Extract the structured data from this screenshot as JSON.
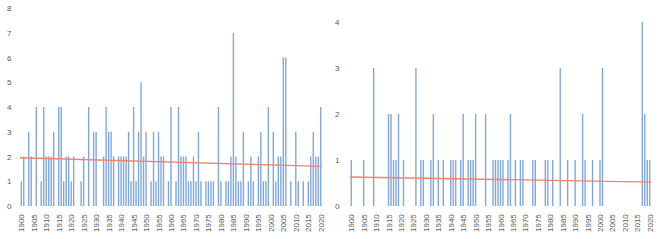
{
  "chart_data": [
    {
      "type": "bar",
      "title": "",
      "xlabel": "",
      "ylabel": "",
      "ylim": [
        0,
        8
      ],
      "yticks": [
        0,
        1,
        2,
        3,
        4,
        5,
        6,
        7,
        8
      ],
      "xtick_labels": [
        "1900",
        "1905",
        "1910",
        "1915",
        "1920",
        "1925",
        "1930",
        "1935",
        "1940",
        "1945",
        "1950",
        "1955",
        "1960",
        "1965",
        "1970",
        "1975",
        "1980",
        "1985",
        "1990",
        "1995",
        "2000",
        "2005",
        "2010",
        "2015",
        "2020"
      ],
      "x_start": 1900,
      "x_end": 2020,
      "grid": false,
      "bar_color": "#7ea6e0",
      "trendline": {
        "type": "linear",
        "color": "#f4826c",
        "start": 1.95,
        "end": 1.6
      },
      "years": [
        1900,
        1901,
        1903,
        1904,
        1906,
        1908,
        1909,
        1910,
        1911,
        1912,
        1913,
        1915,
        1916,
        1917,
        1918,
        1919,
        1920,
        1921,
        1924,
        1925,
        1927,
        1929,
        1930,
        1933,
        1934,
        1935,
        1936,
        1937,
        1939,
        1940,
        1941,
        1942,
        1943,
        1944,
        1945,
        1946,
        1947,
        1948,
        1949,
        1950,
        1952,
        1953,
        1954,
        1955,
        1956,
        1957,
        1959,
        1960,
        1962,
        1963,
        1964,
        1965,
        1966,
        1967,
        1968,
        1969,
        1970,
        1971,
        1972,
        1974,
        1975,
        1976,
        1977,
        1979,
        1980,
        1982,
        1983,
        1984,
        1985,
        1986,
        1987,
        1988,
        1989,
        1991,
        1992,
        1993,
        1995,
        1996,
        1997,
        1998,
        1999,
        2001,
        2002,
        2003,
        2004,
        2005,
        2006,
        2008,
        2010,
        2011,
        2013,
        2015,
        2016,
        2017,
        2018,
        2019,
        2020
      ],
      "values": [
        1,
        2,
        3,
        2,
        4,
        1,
        4,
        2,
        2,
        2,
        3,
        4,
        4,
        1,
        2,
        2,
        1,
        2,
        1,
        2,
        4,
        3,
        3,
        2,
        4,
        3,
        3,
        2,
        2,
        2,
        2,
        2,
        3,
        1,
        4,
        1,
        3,
        5,
        2,
        3,
        1,
        3,
        1,
        3,
        2,
        2,
        1,
        4,
        1,
        4,
        2,
        2,
        2,
        1,
        1,
        2,
        1,
        3,
        1,
        1,
        1,
        1,
        1,
        4,
        1,
        1,
        1,
        2,
        7,
        2,
        1,
        1,
        3,
        1,
        2,
        1,
        2,
        3,
        1,
        1,
        4,
        3,
        1,
        2,
        2,
        6,
        6,
        1,
        3,
        1,
        1,
        1,
        2,
        3,
        2,
        2,
        4
      ]
    },
    {
      "type": "bar",
      "title": "",
      "xlabel": "",
      "ylabel": "",
      "ylim": [
        0,
        4
      ],
      "yticks": [
        0,
        1,
        2,
        3,
        4
      ],
      "xtick_labels": [
        "1900",
        "1905",
        "1910",
        "1915",
        "1920",
        "1925",
        "1930",
        "1935",
        "1940",
        "1945",
        "1950",
        "1955",
        "1960",
        "1965",
        "1970",
        "1975",
        "1980",
        "1985",
        "1990",
        "1995",
        "2000",
        "2005",
        "2010",
        "2015",
        "2020"
      ],
      "x_start": 1900,
      "x_end": 2020,
      "grid": false,
      "bar_color": "#7ea6e0",
      "trendline": {
        "type": "linear",
        "color": "#f4826c",
        "start": 0.63,
        "end": 0.52
      },
      "years": [
        1900,
        1905,
        1909,
        1915,
        1916,
        1917,
        1918,
        1919,
        1921,
        1926,
        1928,
        1929,
        1932,
        1933,
        1935,
        1937,
        1940,
        1941,
        1942,
        1944,
        1945,
        1947,
        1948,
        1949,
        1950,
        1954,
        1957,
        1958,
        1959,
        1960,
        1961,
        1963,
        1964,
        1966,
        1968,
        1969,
        1973,
        1974,
        1978,
        1979,
        1981,
        1984,
        1987,
        1990,
        1993,
        1994,
        1997,
        2000,
        2001,
        2017,
        2018,
        2019,
        2020
      ],
      "values": [
        1,
        1,
        3,
        2,
        2,
        1,
        1,
        2,
        1,
        3,
        1,
        1,
        1,
        2,
        1,
        1,
        1,
        1,
        1,
        1,
        2,
        1,
        1,
        1,
        2,
        2,
        1,
        1,
        1,
        1,
        1,
        1,
        2,
        1,
        1,
        1,
        1,
        1,
        1,
        1,
        1,
        3,
        1,
        1,
        2,
        1,
        1,
        1,
        3,
        4,
        2,
        1,
        1
      ]
    }
  ]
}
